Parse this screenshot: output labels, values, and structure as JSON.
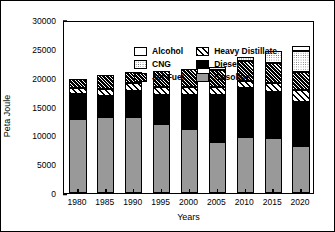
{
  "chart_data": {
    "type": "bar",
    "subtype": "stacked-vertical",
    "title": "",
    "xlabel": "Years",
    "ylabel": "Peta Joule",
    "categories": [
      "1980",
      "1985",
      "1990",
      "1995",
      "2000",
      "2005",
      "2010",
      "2015",
      "2020"
    ],
    "ylim": [
      0,
      30000
    ],
    "yticks": [
      0,
      5000,
      10000,
      15000,
      20000,
      25000,
      30000
    ],
    "ytick_labels": [
      "0",
      "5000",
      "10000",
      "15000",
      "20000",
      "25000",
      "30000"
    ],
    "grid": false,
    "legend_position": "inside-top-left",
    "stack_order_bottom_to_top": [
      "Gasoline",
      "Diesel",
      "Heavy Distillate",
      "Jet Fuel",
      "CNG",
      "Alcohol"
    ],
    "series": [
      {
        "name": "Gasoline",
        "pattern": "solid-gray",
        "color": "#999999",
        "values": [
          12900,
          13150,
          13250,
          12000,
          11150,
          8850,
          9700,
          9500,
          8200
        ]
      },
      {
        "name": "Diesel",
        "pattern": "solid-black",
        "color": "#000000",
        "values": [
          4200,
          3750,
          4450,
          4950,
          5850,
          8200,
          8500,
          8100,
          7650
        ]
      },
      {
        "name": "Heavy Distillate",
        "pattern": "diagonal-hatch",
        "color": "#ffffff",
        "values": [
          1100,
          1200,
          1350,
          1350,
          1300,
          1250,
          1300,
          1400,
          2100
        ]
      },
      {
        "name": "Jet Fuel",
        "pattern": "cross-hatch",
        "color": "#000000",
        "values": [
          1650,
          2300,
          2000,
          2850,
          3200,
          3100,
          3350,
          3600,
          3100
        ]
      },
      {
        "name": "CNG",
        "pattern": "stipple-dots",
        "color": "#ffffff",
        "values": [
          0,
          0,
          0,
          0,
          0,
          400,
          700,
          2100,
          3600
        ]
      },
      {
        "name": "Alcohol",
        "pattern": "solid-white",
        "color": "#ffffff",
        "values": [
          0,
          0,
          0,
          0,
          0,
          0,
          0,
          0,
          900
        ]
      }
    ],
    "totals": [
      19850,
      20400,
      21050,
      21150,
      21500,
      21800,
      23550,
      24700,
      25550
    ]
  },
  "legend": {
    "items": [
      {
        "label": "Alcohol",
        "pattern": "solid-white"
      },
      {
        "label": "Heavy Distillate",
        "pattern": "diagonal-hatch"
      },
      {
        "label": "CNG",
        "pattern": "stipple-dots"
      },
      {
        "label": "Diesel",
        "pattern": "solid-black"
      },
      {
        "label": "Jet Fuel",
        "pattern": "cross-hatch"
      },
      {
        "label": "Gasoline",
        "pattern": "solid-gray"
      }
    ]
  }
}
